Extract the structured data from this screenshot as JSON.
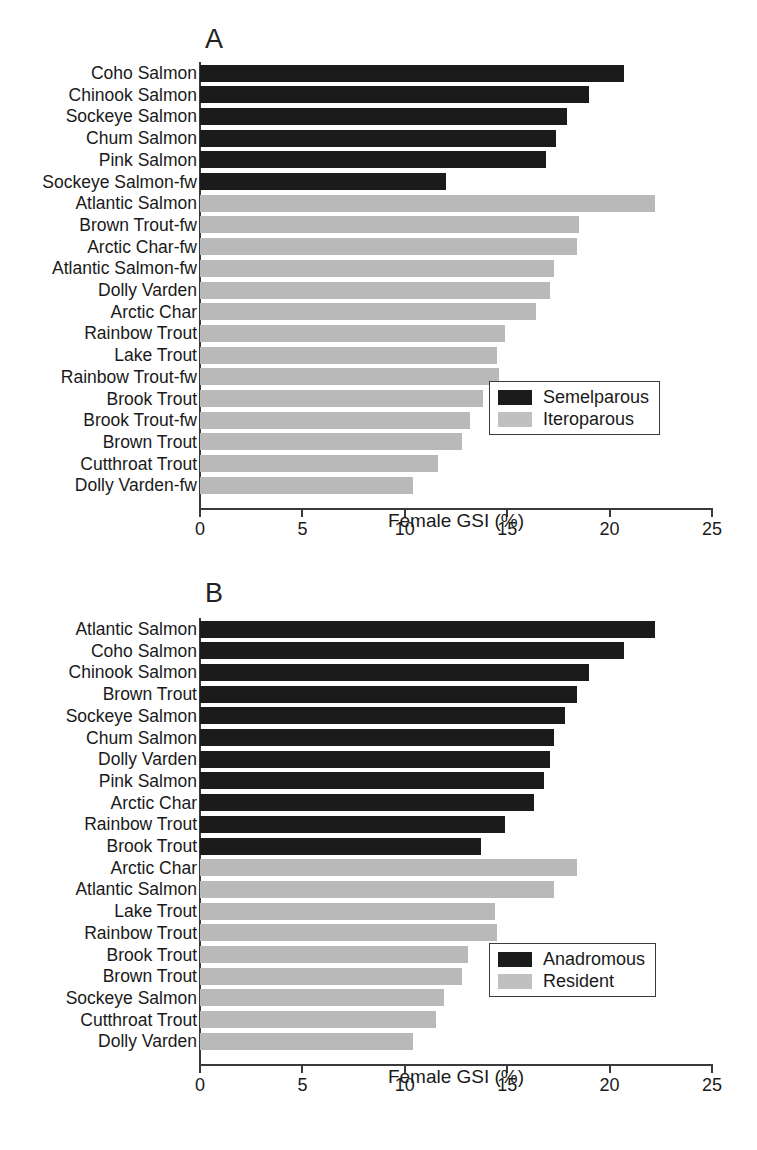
{
  "figure": {
    "xlabel": "Female GSI (%)",
    "colors": {
      "black": "#1b1b1b",
      "gray": "#b9b9b9",
      "axis": "#3a3a3a"
    },
    "ticks": [
      "0",
      "5",
      "10",
      "15",
      "20",
      "25"
    ]
  },
  "panelA": {
    "letter": "A",
    "xlabel": "Female GSI (%)",
    "ticks": [
      "0",
      "5",
      "10",
      "15",
      "20",
      "25"
    ],
    "legend": [
      {
        "label": "Semelparous",
        "color": "black"
      },
      {
        "label": "Iteroparous",
        "color": "gray"
      }
    ],
    "rows": [
      {
        "label": "Coho Salmon",
        "value": 20.7,
        "group": "black"
      },
      {
        "label": "Chinook Salmon",
        "value": 19.0,
        "group": "black"
      },
      {
        "label": "Sockeye Salmon",
        "value": 17.9,
        "group": "black"
      },
      {
        "label": "Chum Salmon",
        "value": 17.4,
        "group": "black"
      },
      {
        "label": "Pink Salmon",
        "value": 16.9,
        "group": "black"
      },
      {
        "label": "Sockeye Salmon-fw",
        "value": 12.0,
        "group": "black"
      },
      {
        "label": "Atlantic Salmon",
        "value": 22.2,
        "group": "gray"
      },
      {
        "label": "Brown Trout-fw",
        "value": 18.5,
        "group": "gray"
      },
      {
        "label": "Arctic Char-fw",
        "value": 18.4,
        "group": "gray"
      },
      {
        "label": "Atlantic Salmon-fw",
        "value": 17.3,
        "group": "gray"
      },
      {
        "label": "Dolly Varden",
        "value": 17.1,
        "group": "gray"
      },
      {
        "label": "Arctic Char",
        "value": 16.4,
        "group": "gray"
      },
      {
        "label": "Rainbow Trout",
        "value": 14.9,
        "group": "gray"
      },
      {
        "label": "Lake Trout",
        "value": 14.5,
        "group": "gray"
      },
      {
        "label": "Rainbow Trout-fw",
        "value": 14.6,
        "group": "gray"
      },
      {
        "label": "Brook Trout",
        "value": 13.8,
        "group": "gray"
      },
      {
        "label": "Brook Trout-fw",
        "value": 13.2,
        "group": "gray"
      },
      {
        "label": "Brown Trout",
        "value": 12.8,
        "group": "gray"
      },
      {
        "label": "Cutthroat Trout",
        "value": 11.6,
        "group": "gray"
      },
      {
        "label": "Dolly Varden-fw",
        "value": 10.4,
        "group": "gray"
      }
    ]
  },
  "panelB": {
    "letter": "B",
    "xlabel": "Female GSI (%)",
    "ticks": [
      "0",
      "5",
      "10",
      "15",
      "20",
      "25"
    ],
    "legend": [
      {
        "label": "Anadromous",
        "color": "black"
      },
      {
        "label": "Resident",
        "color": "gray"
      }
    ],
    "rows": [
      {
        "label": "Atlantic Salmon",
        "value": 22.2,
        "group": "black"
      },
      {
        "label": "Coho Salmon",
        "value": 20.7,
        "group": "black"
      },
      {
        "label": "Chinook Salmon",
        "value": 19.0,
        "group": "black"
      },
      {
        "label": "Brown Trout",
        "value": 18.4,
        "group": "black"
      },
      {
        "label": "Sockeye Salmon",
        "value": 17.8,
        "group": "black"
      },
      {
        "label": "Chum Salmon",
        "value": 17.3,
        "group": "black"
      },
      {
        "label": "Dolly Varden",
        "value": 17.1,
        "group": "black"
      },
      {
        "label": "Pink Salmon",
        "value": 16.8,
        "group": "black"
      },
      {
        "label": "Arctic Char",
        "value": 16.3,
        "group": "black"
      },
      {
        "label": "Rainbow Trout",
        "value": 14.9,
        "group": "black"
      },
      {
        "label": "Brook Trout",
        "value": 13.7,
        "group": "black"
      },
      {
        "label": "Arctic Char",
        "value": 18.4,
        "group": "gray"
      },
      {
        "label": "Atlantic Salmon",
        "value": 17.3,
        "group": "gray"
      },
      {
        "label": "Lake Trout",
        "value": 14.4,
        "group": "gray"
      },
      {
        "label": "Rainbow Trout",
        "value": 14.5,
        "group": "gray"
      },
      {
        "label": "Brook Trout",
        "value": 13.1,
        "group": "gray"
      },
      {
        "label": "Brown Trout",
        "value": 12.8,
        "group": "gray"
      },
      {
        "label": "Sockeye Salmon",
        "value": 11.9,
        "group": "gray"
      },
      {
        "label": "Cutthroat Trout",
        "value": 11.5,
        "group": "gray"
      },
      {
        "label": "Dolly Varden",
        "value": 10.4,
        "group": "gray"
      }
    ]
  },
  "chart_data": {
    "type": "bar",
    "orientation": "horizontal",
    "title": "",
    "xlabel": "Female GSI (%)",
    "ylabel": "",
    "xlim": [
      0,
      25
    ],
    "xticks": [
      0,
      5,
      10,
      15,
      20,
      25
    ],
    "grid": false,
    "panels": [
      {
        "panel": "A",
        "legend_position": "middle-right",
        "legend": [
          "Semelparous",
          "Iteroparous"
        ],
        "categories": [
          "Coho Salmon",
          "Chinook Salmon",
          "Sockeye Salmon",
          "Chum Salmon",
          "Pink Salmon",
          "Sockeye Salmon-fw",
          "Atlantic Salmon",
          "Brown Trout-fw",
          "Arctic Char-fw",
          "Atlantic Salmon-fw",
          "Dolly Varden",
          "Arctic Char",
          "Rainbow Trout",
          "Lake Trout",
          "Rainbow Trout-fw",
          "Brook Trout",
          "Brook Trout-fw",
          "Brown Trout",
          "Cutthroat Trout",
          "Dolly Varden-fw"
        ],
        "values": [
          20.7,
          19.0,
          17.9,
          17.4,
          16.9,
          12.0,
          22.2,
          18.5,
          18.4,
          17.3,
          17.1,
          16.4,
          14.9,
          14.5,
          14.6,
          13.8,
          13.2,
          12.8,
          11.6,
          10.4
        ],
        "groups": [
          "Semelparous",
          "Semelparous",
          "Semelparous",
          "Semelparous",
          "Semelparous",
          "Semelparous",
          "Iteroparous",
          "Iteroparous",
          "Iteroparous",
          "Iteroparous",
          "Iteroparous",
          "Iteroparous",
          "Iteroparous",
          "Iteroparous",
          "Iteroparous",
          "Iteroparous",
          "Iteroparous",
          "Iteroparous",
          "Iteroparous",
          "Iteroparous"
        ]
      },
      {
        "panel": "B",
        "legend_position": "lower-right",
        "legend": [
          "Anadromous",
          "Resident"
        ],
        "categories": [
          "Atlantic Salmon",
          "Coho Salmon",
          "Chinook Salmon",
          "Brown Trout",
          "Sockeye Salmon",
          "Chum Salmon",
          "Dolly Varden",
          "Pink Salmon",
          "Arctic Char",
          "Rainbow Trout",
          "Brook Trout",
          "Arctic Char",
          "Atlantic Salmon",
          "Lake Trout",
          "Rainbow Trout",
          "Brook Trout",
          "Brown Trout",
          "Sockeye Salmon",
          "Cutthroat Trout",
          "Dolly Varden"
        ],
        "values": [
          22.2,
          20.7,
          19.0,
          18.4,
          17.8,
          17.3,
          17.1,
          16.8,
          16.3,
          14.9,
          13.7,
          18.4,
          17.3,
          14.4,
          14.5,
          13.1,
          12.8,
          11.9,
          11.5,
          10.4
        ],
        "groups": [
          "Anadromous",
          "Anadromous",
          "Anadromous",
          "Anadromous",
          "Anadromous",
          "Anadromous",
          "Anadromous",
          "Anadromous",
          "Anadromous",
          "Anadromous",
          "Anadromous",
          "Resident",
          "Resident",
          "Resident",
          "Resident",
          "Resident",
          "Resident",
          "Resident",
          "Resident",
          "Resident"
        ]
      }
    ]
  }
}
